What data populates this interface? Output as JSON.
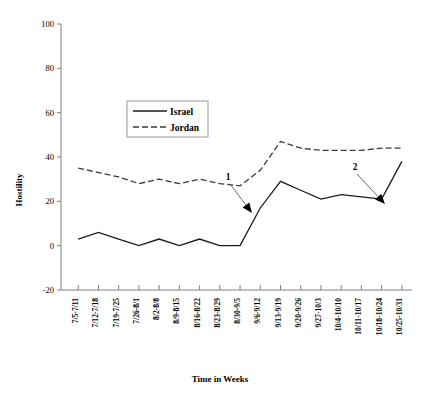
{
  "chart_data": {
    "type": "line",
    "title": "",
    "xlabel": "Time in Weeks",
    "ylabel": "Hostility",
    "ylim": [
      -20,
      100
    ],
    "yticks": [
      -20,
      0,
      20,
      40,
      60,
      80,
      100
    ],
    "ytick_labels": [
      "-20",
      "0",
      "20",
      "40",
      "60",
      "80",
      "100"
    ],
    "grid": false,
    "legend_position": "upper-center",
    "categories": [
      "7/5-7/11",
      "7/12-7/18",
      "7/19-7/25",
      "7/26-8/1",
      "8/2-8/8",
      "8/9-8/15",
      "8/16-8/22",
      "8/23-8/29",
      "8/30-9/5",
      "9/6-9/12",
      "9/13-9/19",
      "9/20-9/26",
      "9/27-10/3",
      "10/4-10/10",
      "10/11-10/17",
      "10/18-10/24",
      "10/25-10/31"
    ],
    "series": [
      {
        "name": "Israel",
        "style": "solid",
        "color": "#1a1a1a",
        "values": [
          3,
          6,
          3,
          0,
          3,
          0,
          3,
          0,
          0,
          17,
          29,
          25,
          21,
          23,
          22,
          21,
          38
        ]
      },
      {
        "name": "Jordan",
        "style": "dashed",
        "color": "#3a3a3a",
        "values": [
          35,
          33,
          31,
          28,
          30,
          28,
          30,
          28,
          27,
          34,
          47,
          44,
          43,
          43,
          43,
          44,
          44
        ]
      }
    ],
    "annotations": [
      {
        "label": "1",
        "label_x": 228,
        "label_y": 180,
        "target_x": 252,
        "target_y": 213
      },
      {
        "label": "2",
        "label_x": 355,
        "label_y": 170,
        "target_x": 385,
        "target_y": 204
      }
    ]
  },
  "legend": {
    "entries": [
      {
        "label": "Israel"
      },
      {
        "label": "Jordan"
      }
    ]
  }
}
